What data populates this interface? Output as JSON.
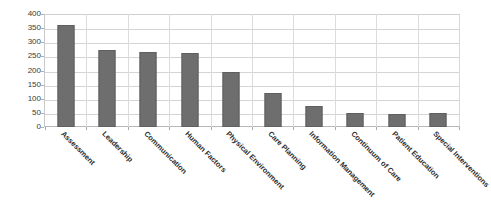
{
  "chart_data": {
    "type": "bar",
    "title": "",
    "subtitle": "",
    "xlabel": "",
    "ylabel": "",
    "ylim": [
      0,
      400
    ],
    "ytick_step": 50,
    "yticks": [
      400,
      350,
      300,
      250,
      200,
      150,
      100,
      50,
      0
    ],
    "grid": true,
    "legend": false,
    "legend_position": "none",
    "bar_color": "#6e6e6e",
    "gridline_color": "#d4d4d4",
    "background_color": "#ffffff",
    "xtick_rotation": -45,
    "categories": [
      "Assessment",
      "Leadership",
      "Communication",
      "Human Factors",
      "Physical Environment",
      "Care Planning",
      "Information Management",
      "Continuum of Care",
      "Patient Education",
      "Special Interventions"
    ],
    "values": [
      362,
      272,
      265,
      262,
      195,
      120,
      75,
      48,
      46,
      50
    ]
  },
  "axis": {
    "y_labels": [
      "400",
      "350",
      "300",
      "250",
      "200",
      "150",
      "100",
      "50",
      "0"
    ]
  }
}
